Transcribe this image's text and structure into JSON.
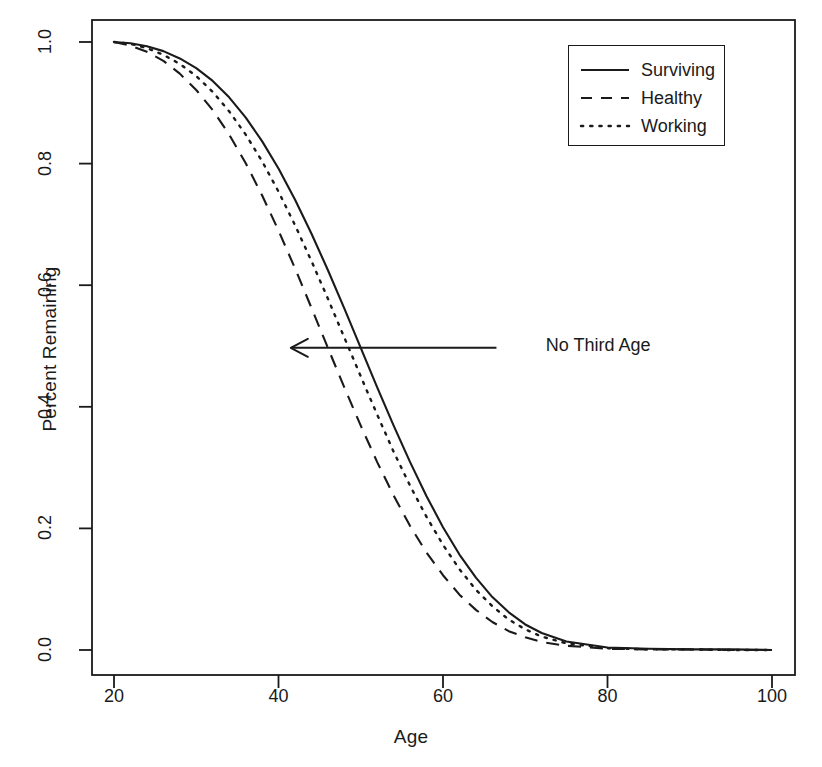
{
  "chart_data": {
    "type": "line",
    "title": "",
    "xlabel": "Age",
    "ylabel": "Percent Remaining",
    "xlim": [
      20,
      100
    ],
    "ylim": [
      0.0,
      1.0
    ],
    "xticks": [
      20,
      40,
      60,
      80,
      100
    ],
    "xtick_labels": [
      "20",
      "40",
      "60",
      "80",
      "100"
    ],
    "yticks": [
      0.0,
      0.2,
      0.4,
      0.6,
      0.8,
      1.0
    ],
    "ytick_labels": [
      "0.0",
      "0.2",
      "0.4",
      "0.6",
      "0.8",
      "1.0"
    ],
    "grid": false,
    "legend_position": "top-right",
    "frame": true,
    "line_color": "#1a1a1a",
    "x": [
      20,
      22,
      24,
      26,
      28,
      30,
      32,
      34,
      36,
      38,
      40,
      42,
      44,
      46,
      48,
      50,
      52,
      54,
      56,
      58,
      60,
      62,
      64,
      66,
      68,
      70,
      72,
      75,
      80,
      85,
      90,
      95,
      100
    ],
    "series": [
      {
        "name": "Surviving",
        "style": "solid",
        "values": [
          1.0,
          0.998,
          0.993,
          0.985,
          0.973,
          0.957,
          0.936,
          0.909,
          0.876,
          0.837,
          0.792,
          0.741,
          0.685,
          0.625,
          0.562,
          0.497,
          0.432,
          0.369,
          0.309,
          0.253,
          0.202,
          0.157,
          0.119,
          0.087,
          0.062,
          0.042,
          0.028,
          0.014,
          0.004,
          0.002,
          0.001,
          0.001,
          0.0
        ]
      },
      {
        "name": "Healthy",
        "style": "dashed",
        "values": [
          1.0,
          0.994,
          0.984,
          0.969,
          0.948,
          0.921,
          0.888,
          0.848,
          0.801,
          0.748,
          0.69,
          0.628,
          0.563,
          0.497,
          0.432,
          0.369,
          0.309,
          0.254,
          0.204,
          0.16,
          0.123,
          0.091,
          0.066,
          0.046,
          0.031,
          0.021,
          0.013,
          0.007,
          0.002,
          0.001,
          0.001,
          0.0,
          0.0
        ]
      },
      {
        "name": "Working",
        "style": "dotted",
        "values": [
          1.0,
          0.997,
          0.99,
          0.979,
          0.964,
          0.944,
          0.918,
          0.886,
          0.848,
          0.804,
          0.754,
          0.699,
          0.64,
          0.578,
          0.514,
          0.45,
          0.387,
          0.326,
          0.27,
          0.219,
          0.173,
          0.133,
          0.099,
          0.072,
          0.05,
          0.034,
          0.022,
          0.011,
          0.003,
          0.001,
          0.001,
          0.0,
          0.0
        ]
      }
    ],
    "annotations": [
      {
        "text": "No Third Age",
        "arrow": true,
        "arrow_from_x": 66.5,
        "arrow_from_y": 0.497,
        "arrow_to_x": 41.5,
        "arrow_to_y": 0.497,
        "text_x": 72.5,
        "text_y": 0.497
      }
    ]
  },
  "legend": {
    "entries": [
      {
        "label": "Surviving",
        "style": "solid"
      },
      {
        "label": "Healthy",
        "style": "dashed"
      },
      {
        "label": "Working",
        "style": "dotted"
      }
    ]
  },
  "annotation": {
    "label": "No Third Age"
  },
  "axes": {
    "x_title": "Age",
    "y_title": "Percent Remaining"
  }
}
